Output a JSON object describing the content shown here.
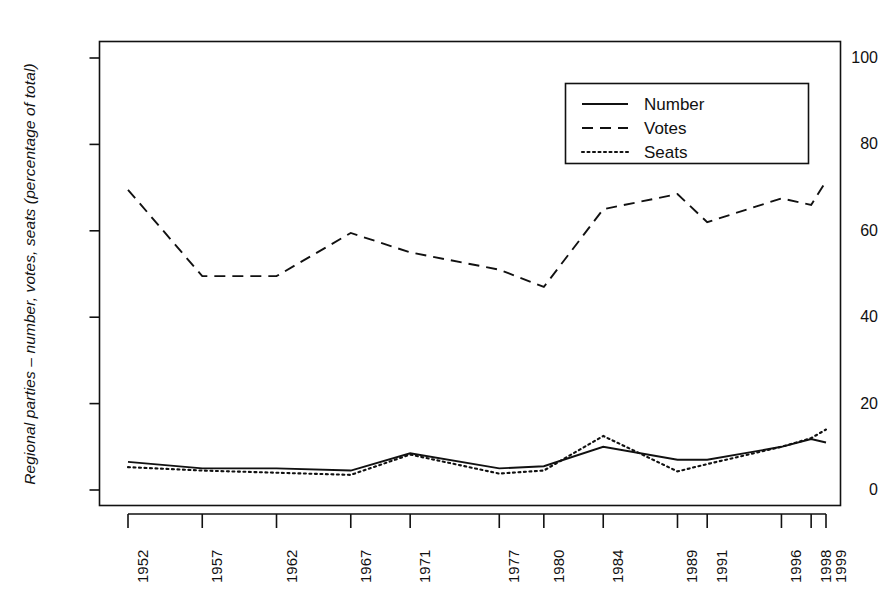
{
  "chart_data": {
    "type": "line",
    "title": "",
    "xlabel": "",
    "ylabel": "Regional parties – number, votes, seats (percentage of total)",
    "ylim": [
      0,
      100
    ],
    "yticks": [
      0,
      20,
      40,
      60,
      80,
      100
    ],
    "ytick_labels": [
      "0",
      "20",
      "40",
      "60",
      "80",
      "100"
    ],
    "grid": false,
    "legend_position": "top-right",
    "categories": [
      "1952",
      "1957",
      "1962",
      "1967",
      "1971",
      "1977",
      "1980",
      "1984",
      "1989",
      "1991",
      "1996",
      "1998",
      "1999"
    ],
    "x": [
      1952,
      1957,
      1962,
      1967,
      1971,
      1977,
      1980,
      1984,
      1989,
      1991,
      1996,
      1998,
      1999
    ],
    "series": [
      {
        "name": "Number",
        "style": "solid",
        "values": [
          6.5,
          5.0,
          5.0,
          4.5,
          8.5,
          5.0,
          5.5,
          10.0,
          7.0,
          7.0,
          10.0,
          11.8,
          11.0
        ]
      },
      {
        "name": "Votes",
        "style": "dashed",
        "values": [
          69.5,
          49.5,
          49.5,
          59.5,
          55.0,
          51.0,
          47.0,
          65.0,
          68.5,
          62.0,
          67.5,
          66.0,
          71.5
        ]
      },
      {
        "name": "Seats",
        "style": "dotted",
        "values": [
          5.3,
          4.5,
          4.0,
          3.5,
          8.2,
          3.8,
          4.5,
          12.5,
          4.3,
          6.0,
          10.0,
          12.0,
          14.0
        ]
      }
    ]
  },
  "legend": {
    "entries": [
      {
        "label": "Number",
        "style": "solid"
      },
      {
        "label": "Votes",
        "style": "dashed"
      },
      {
        "label": "Seats",
        "style": "dotted"
      }
    ]
  },
  "colors": {
    "line": "#111111",
    "frame": "#111111",
    "background": "#ffffff"
  }
}
